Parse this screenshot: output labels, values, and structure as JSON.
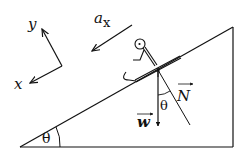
{
  "diagram": {
    "axes": {
      "x_label": "x",
      "y_label": "y"
    },
    "acceleration": {
      "symbol": "a",
      "subscript": "x"
    },
    "forces": {
      "normal_label": "N",
      "weight_label": "w"
    },
    "angles": {
      "incline_angle": "θ",
      "force_angle": "θ"
    },
    "colors": {
      "stroke": "#111111",
      "background": "#ffffff"
    }
  }
}
